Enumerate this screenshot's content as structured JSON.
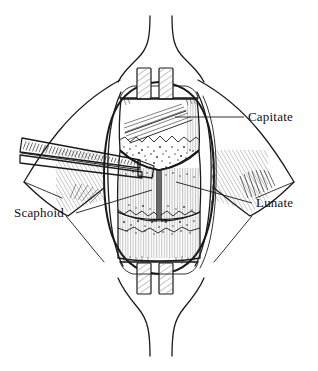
{
  "figure": {
    "kind": "surgical-line-illustration",
    "view": "dorsal",
    "background_color": "#ffffff",
    "ink_color": "#1a1a1a",
    "width_px": 318,
    "height_px": 371
  },
  "labels": [
    {
      "id": "capitate",
      "text": "Capitate",
      "text_x": 248,
      "text_y": 121,
      "anchor": "start",
      "leader": "M 244 117 L 175 117",
      "target": "capitate-bone"
    },
    {
      "id": "lunate",
      "text": "Lunate",
      "text_x": 256,
      "text_y": 207,
      "anchor": "start",
      "leader": "M 252 203 L 176 182",
      "target": "lunate-bone"
    },
    {
      "id": "scaphoid",
      "text": "Scaphoid",
      "text_x": 14,
      "text_y": 217,
      "anchor": "start",
      "leader": "M 76 213 L 152 190",
      "target": "scaphoid-bone"
    }
  ],
  "anatomy": {
    "capitate": {
      "name": "Capitate",
      "region": "proximal-central carpus"
    },
    "lunate": {
      "name": "Lunate",
      "region": "proximal carpal row, ulnar"
    },
    "scaphoid": {
      "name": "Scaphoid",
      "region": "proximal carpal row, radial"
    }
  },
  "instruments": [
    {
      "id": "elevator",
      "name": "periosteal-elevator",
      "entry": "left",
      "tip_x": 140,
      "tip_y": 162
    }
  ],
  "retractors": [
    {
      "id": "proximal-retractor",
      "position": "top",
      "blade_count": 2
    },
    {
      "id": "distal-retractor",
      "position": "bottom",
      "blade_count": 2
    }
  ],
  "skin_incision": {
    "shape": "longitudinal-dorsal",
    "flaps": 2
  }
}
